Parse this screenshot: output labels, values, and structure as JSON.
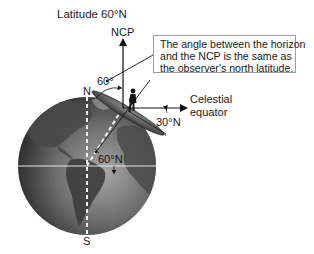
{
  "title": "Latitude 60°N",
  "labels": {
    "ncp": "NCP",
    "horizon_ncp_angle": "60°",
    "north_pole": "N",
    "south_pole": "S",
    "equator_angle": "30°N",
    "observer_latitude": "60°N",
    "celestial_equator_line1": "Celestial",
    "celestial_equator_line2": "equator"
  },
  "callout": {
    "lines": [
      "The angle between the horizon",
      "and the NCP is the same as",
      "the observer's north latitude."
    ]
  },
  "colors": {
    "globe_dark": "#2e2e2e",
    "globe_mid": "#6a6a6a",
    "globe_light": "#9c9c9c",
    "equator_line": "#e0e0e0",
    "arrow": "#111111",
    "callout_border": "#9a9a9a"
  }
}
